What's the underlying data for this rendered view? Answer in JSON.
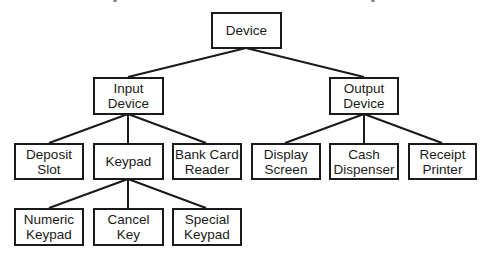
{
  "diagram": {
    "type": "hierarchy-tree",
    "root": {
      "id": "device",
      "lines": [
        "Device"
      ],
      "children": [
        {
          "id": "input-device",
          "lines": [
            "Input",
            "Device"
          ],
          "children": [
            {
              "id": "deposit-slot",
              "lines": [
                "Deposit",
                "Slot"
              ]
            },
            {
              "id": "keypad",
              "lines": [
                "Keypad"
              ],
              "children": [
                {
                  "id": "numeric-keypad",
                  "lines": [
                    "Numeric",
                    "Keypad"
                  ]
                },
                {
                  "id": "cancel-key",
                  "lines": [
                    "Cancel",
                    "Key"
                  ]
                },
                {
                  "id": "special-keypad",
                  "lines": [
                    "Special",
                    "Keypad"
                  ]
                }
              ]
            },
            {
              "id": "bank-card-reader",
              "lines": [
                "Bank Card",
                "Reader"
              ]
            }
          ]
        },
        {
          "id": "output-device",
          "lines": [
            "Output",
            "Device"
          ],
          "children": [
            {
              "id": "display-screen",
              "lines": [
                "Display",
                "Screen"
              ]
            },
            {
              "id": "cash-dispenser",
              "lines": [
                "Cash",
                "Dispenser"
              ]
            },
            {
              "id": "receipt-printer",
              "lines": [
                "Receipt",
                "Printer"
              ]
            }
          ]
        }
      ]
    }
  },
  "nodes": {
    "device": {
      "l1": "Device"
    },
    "input_device": {
      "l1": "Input",
      "l2": "Device"
    },
    "output_device": {
      "l1": "Output",
      "l2": "Device"
    },
    "deposit_slot": {
      "l1": "Deposit",
      "l2": "Slot"
    },
    "keypad": {
      "l1": "Keypad"
    },
    "bank_card_reader": {
      "l1": "Bank Card",
      "l2": "Reader"
    },
    "display_screen": {
      "l1": "Display",
      "l2": "Screen"
    },
    "cash_dispenser": {
      "l1": "Cash",
      "l2": "Dispenser"
    },
    "receipt_printer": {
      "l1": "Receipt",
      "l2": "Printer"
    },
    "numeric_keypad": {
      "l1": "Numeric",
      "l2": "Keypad"
    },
    "cancel_key": {
      "l1": "Cancel",
      "l2": "Key"
    },
    "special_keypad": {
      "l1": "Special",
      "l2": "Keypad"
    }
  },
  "colors": {
    "stroke": "#1a1a1a",
    "background": "#ffffff",
    "text": "#1a1a1a"
  }
}
